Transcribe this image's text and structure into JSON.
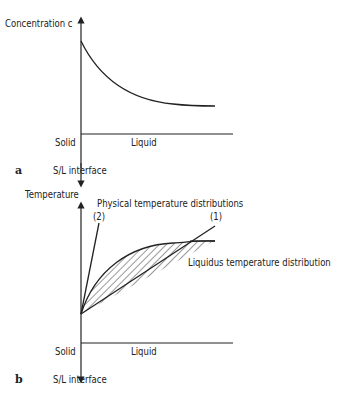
{
  "panel_a": {
    "letter": "a",
    "y_axis_label": "Concentration c",
    "solid_label": "Solid",
    "liquid_label": "Liquid",
    "interface_label": "S/L interface"
  },
  "panel_b": {
    "letter": "b",
    "y_axis_label": "Temperature",
    "physical_label": "Physical temperature distributions",
    "curve2_label": "(2)",
    "curve1_label": "(1)",
    "liquidus_label": "Liquidus temperature distribution",
    "solid_label": "Solid",
    "liquid_label": "Liquid",
    "interface_label": "S/L interface"
  }
}
